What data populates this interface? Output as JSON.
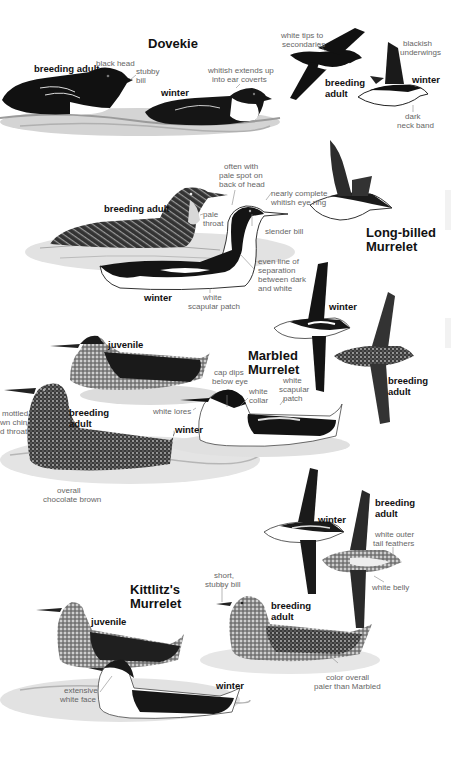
{
  "page": {
    "background": "#ffffff",
    "ink_color": "#111111",
    "label_color": "#666666"
  },
  "species": [
    {
      "name": "Dovekie",
      "figures": [
        {
          "tag": "breeding adult",
          "pose": "swimming"
        },
        {
          "tag": "winter",
          "pose": "swimming"
        },
        {
          "tag": "breeding adult",
          "pose": "flying"
        },
        {
          "tag": "winter",
          "pose": "flying"
        }
      ],
      "annotations": [
        "black head",
        "stubby bill",
        "whitish extends up into ear coverts",
        "white tips to secondaries",
        "blackish underwings",
        "dark neck band"
      ]
    },
    {
      "name": "Long-billed Murrelet",
      "figures": [
        {
          "tag": "breeding adult",
          "pose": "swimming"
        },
        {
          "tag": "winter",
          "pose": "swimming"
        },
        {
          "tag": "",
          "pose": "flying"
        }
      ],
      "annotations": [
        "often with pale spot on back of head",
        "nearly complete whitish eye ring",
        "pale throat",
        "slender bill",
        "even line of separation between dark and white",
        "white scapular patch"
      ]
    },
    {
      "name": "Marbled Murrelet",
      "figures": [
        {
          "tag": "juvenile",
          "pose": "swimming"
        },
        {
          "tag": "breeding adult",
          "pose": "swimming"
        },
        {
          "tag": "winter",
          "pose": "swimming"
        },
        {
          "tag": "winter",
          "pose": "flying"
        },
        {
          "tag": "breeding adult",
          "pose": "flying"
        }
      ],
      "annotations": [
        "mottled brown chin and throat",
        "overall chocolate brown",
        "cap dips below eye",
        "white lores",
        "white collar",
        "white scapular patch"
      ]
    },
    {
      "name": "Kittlitz's Murrelet",
      "figures": [
        {
          "tag": "winter",
          "pose": "flying"
        },
        {
          "tag": "breeding adult",
          "pose": "flying"
        },
        {
          "tag": "juvenile",
          "pose": "swimming"
        },
        {
          "tag": "breeding adult",
          "pose": "swimming"
        },
        {
          "tag": "winter",
          "pose": "swimming"
        }
      ],
      "annotations": [
        "white outer tail feathers",
        "white belly",
        "short, stubby bill",
        "extensive white face",
        "color overall paler than Marbled"
      ]
    }
  ],
  "titles": {
    "dovekie": "Dovekie",
    "long_billed_1": "Long-billed",
    "long_billed_2": "Murrelet",
    "marbled_1": "Marbled",
    "marbled_2": "Murrelet",
    "kittlitz_1": "Kittlitz's",
    "kittlitz_2": "Murrelet"
  },
  "tags": {
    "dov_breeding": "breeding adult",
    "dov_winter": "winter",
    "dov_fly_breeding_1": "breeding",
    "dov_fly_breeding_2": "adult",
    "dov_fly_winter": "winter",
    "lb_breeding": "breeding adult",
    "lb_winter": "winter",
    "mm_juvenile": "juvenile",
    "mm_breeding_1": "breeding",
    "mm_breeding_2": "adult",
    "mm_winter": "winter",
    "mm_fly_winter": "winter",
    "mm_fly_breeding_1": "breeding",
    "mm_fly_breeding_2": "adult",
    "km_fly_winter": "winter",
    "km_fly_breeding_1": "breeding",
    "km_fly_breeding_2": "adult",
    "km_juvenile": "juvenile",
    "km_breeding_1": "breeding",
    "km_breeding_2": "adult",
    "km_winter": "winter"
  },
  "notes": {
    "black_head": "black head",
    "stubby_1": "stubby",
    "stubby_2": "bill",
    "ear_1": "whitish extends up",
    "ear_2": "into ear coverts",
    "tips_1": "white tips to",
    "tips_2": "secondaries",
    "underwing_1": "blackish",
    "underwing_2": "underwings",
    "neckband_1": "dark",
    "neckband_2": "neck band",
    "palespot_1": "often with",
    "palespot_2": "pale spot on",
    "palespot_3": "back of head",
    "eyering_1": "nearly complete",
    "eyering_2": "whitish eye ring",
    "pale_throat_1": "pale",
    "pale_throat_2": "throat",
    "slender_bill": "slender bill",
    "sep_1": "even line of",
    "sep_2": "separation",
    "sep_3": "between dark",
    "sep_4": "and white",
    "scap_1": "white",
    "scap_2": "scapular patch",
    "mottled_1": "mottled",
    "mottled_2": "wn chin",
    "mottled_3": "d throat",
    "choc_1": "overall",
    "choc_2": "chocolate brown",
    "cap_1": "cap dips",
    "cap_2": "below eye",
    "lores": "white lores",
    "collar_1": "white",
    "collar_2": "collar",
    "mscap_1": "white",
    "mscap_2": "scapular",
    "mscap_3": "patch",
    "outertail_1": "white outer",
    "outertail_2": "tail feathers",
    "belly": "white belly",
    "short_1": "short,",
    "short_2": "stubby bill",
    "face_1": "extensive",
    "face_2": "white face",
    "paler_1": "color overall",
    "paler_2": "paler than Marbled"
  }
}
